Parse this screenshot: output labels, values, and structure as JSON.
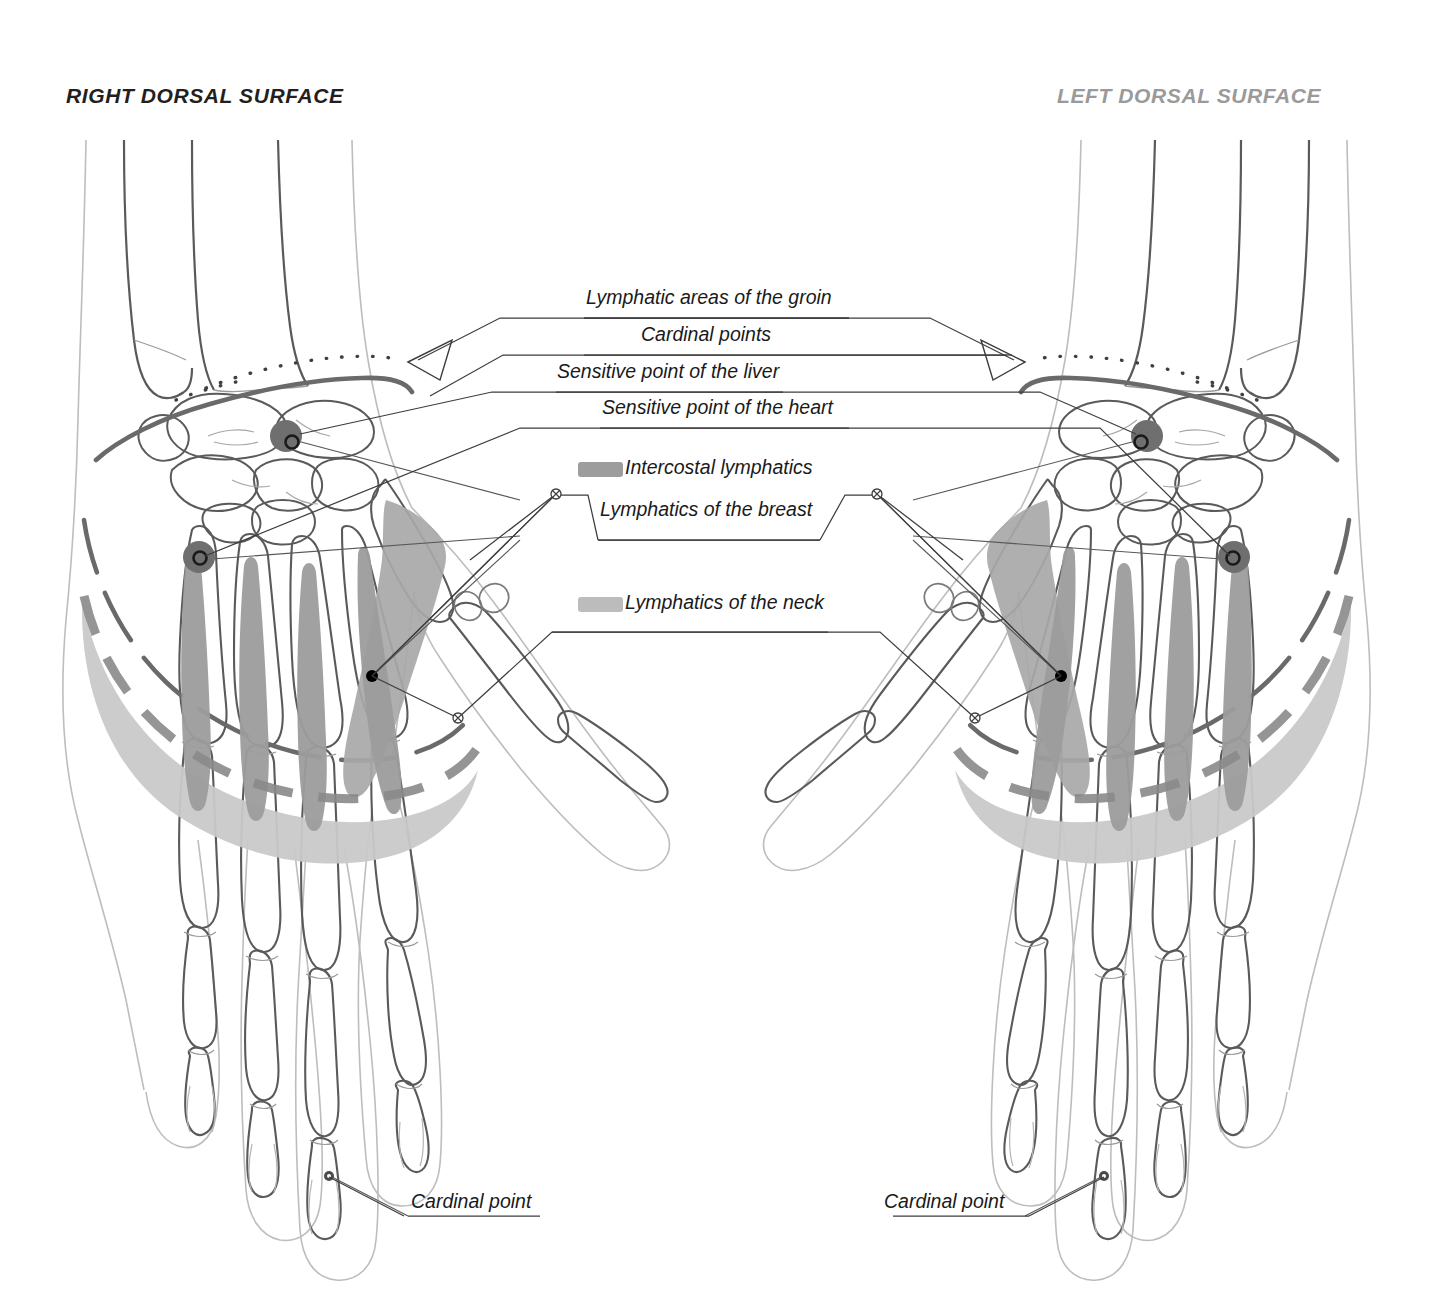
{
  "page": {
    "background": "#ffffff",
    "width": 1433,
    "height": 1304
  },
  "titles": {
    "right": "RIGHT DORSAL SURFACE",
    "left": "LEFT DORSAL SURFACE",
    "right_color": "#231f20",
    "left_color": "#9a9a9a"
  },
  "legend": {
    "items": [
      {
        "id": "lymphatic-areas-groin",
        "label": "Lymphatic areas of the groin",
        "swatch": null
      },
      {
        "id": "cardinal-points",
        "label": "Cardinal points",
        "swatch": null
      },
      {
        "id": "sensitive-point-liver",
        "label": "Sensitive point of the liver",
        "swatch": null
      },
      {
        "id": "sensitive-point-heart",
        "label": "Sensitive point of the heart",
        "swatch": null
      },
      {
        "id": "intercostal-lymphatics",
        "label": "Intercostal lymphatics",
        "swatch": "#9d9d9d"
      },
      {
        "id": "lymphatics-breast",
        "label": "Lymphatics of the breast",
        "swatch": null
      },
      {
        "id": "lymphatics-neck",
        "label": "Lymphatics of the neck",
        "swatch": "#bcbcbc"
      }
    ]
  },
  "callouts": {
    "cardinal_point_left": "Cardinal point",
    "cardinal_point_right": "Cardinal point"
  },
  "colors": {
    "bone_outline": "#4a4a4a",
    "skin_outline": "#b9b9b9",
    "heavy_line": "#6e6e6e",
    "dashed_arc": "#8a8a8a",
    "intercostal_band": "#9d9d9d",
    "neck_band": "#c9c9c9",
    "breast_band": "#a8a8a8",
    "cardinal_marker": "#6f6f6f",
    "leader_line": "#4a4a4a",
    "text": "#1a1a1a"
  },
  "anatomy": {
    "view": "dorsal surface of both hands, skeletal overlay",
    "hands": [
      {
        "side": "right",
        "position": "left half of image"
      },
      {
        "side": "left",
        "position": "right half of image"
      }
    ],
    "markers": {
      "cardinal_wrist": 2,
      "cardinal_metacarpal": 2,
      "cardinal_fingertip": 2,
      "dot_breast": 2
    }
  }
}
